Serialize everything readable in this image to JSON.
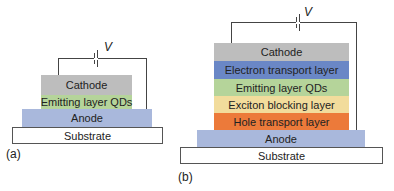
{
  "panel_a": {
    "label": "(a)",
    "voltage": "V",
    "layers": [
      {
        "name": "Cathode",
        "color": "#bdbdbd"
      },
      {
        "name": "Emitting layer QDs",
        "color": "#b5d49a"
      },
      {
        "name": "Anode",
        "color": "#a9b8dc"
      },
      {
        "name": "Substrate",
        "color": "#ffffff"
      }
    ]
  },
  "panel_b": {
    "label": "(b)",
    "voltage": "V",
    "layers": [
      {
        "name": "Cathode",
        "color": "#bdbdbd"
      },
      {
        "name": "Electron transport layer",
        "color": "#6a87c6"
      },
      {
        "name": "Emitting layer QDs",
        "color": "#b5d49a"
      },
      {
        "name": "Exciton blocking layer",
        "color": "#f2dc9c"
      },
      {
        "name": "Hole transport layer",
        "color": "#ec7a3a"
      },
      {
        "name": "Anode",
        "color": "#a9b8dc"
      },
      {
        "name": "Substrate",
        "color": "#ffffff"
      }
    ]
  }
}
